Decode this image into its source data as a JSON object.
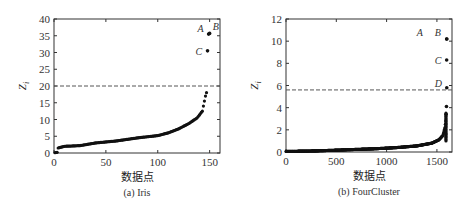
{
  "chart_data": [
    {
      "type": "scatter",
      "title": "",
      "caption": "(a) Iris",
      "xlabel": "数据点",
      "ylabel": "Z_i",
      "xlim": [
        0,
        160
      ],
      "ylim": [
        0,
        40
      ],
      "xticks": [
        0,
        50,
        100,
        150
      ],
      "yticks": [
        0,
        5,
        10,
        15,
        20,
        25,
        30,
        35,
        40
      ],
      "xtick_labels": [
        "0",
        "50",
        "100",
        "150"
      ],
      "ytick_labels": [
        "0",
        "5",
        "10",
        "15",
        "20",
        "25",
        "30",
        "35",
        "40"
      ],
      "threshold": 20,
      "threshold_style": "dashed",
      "n_points": 150,
      "curve_description": "sorted ascending scores",
      "curve_knots": [
        [
          1,
          0.1
        ],
        [
          3,
          0.2
        ],
        [
          4,
          1.5
        ],
        [
          10,
          2.0
        ],
        [
          25,
          2.2
        ],
        [
          40,
          3.0
        ],
        [
          60,
          3.6
        ],
        [
          80,
          4.5
        ],
        [
          100,
          5.2
        ],
        [
          110,
          6.0
        ],
        [
          120,
          7.2
        ],
        [
          130,
          8.8
        ],
        [
          138,
          10.5
        ],
        [
          143,
          12.5
        ],
        [
          144,
          14.0
        ],
        [
          146,
          17.0
        ],
        [
          147,
          18.0
        ]
      ],
      "outliers": [
        {
          "label": "A",
          "x": 149,
          "y": 35.5
        },
        {
          "label": "B",
          "x": 150,
          "y": 35.7
        },
        {
          "label": "C",
          "x": 148,
          "y": 30.5
        }
      ],
      "grid": false
    },
    {
      "type": "scatter",
      "title": "",
      "caption": "(b) FourCluster",
      "xlabel": "数据点",
      "ylabel": "Z_i",
      "xlim": [
        0,
        1650
      ],
      "ylim": [
        0,
        12
      ],
      "xticks": [
        0,
        500,
        1000,
        1500
      ],
      "yticks": [
        0,
        2,
        4,
        6,
        8,
        10,
        12
      ],
      "xtick_labels": [
        "0",
        "500",
        "1000",
        "1500"
      ],
      "ytick_labels": [
        "0",
        "2",
        "4",
        "6",
        "8",
        "10",
        "12"
      ],
      "threshold": 5.6,
      "threshold_style": "dashed",
      "n_points": 1600,
      "curve_description": "sorted ascending scores",
      "curve_knots": [
        [
          0,
          0.05
        ],
        [
          300,
          0.1
        ],
        [
          600,
          0.2
        ],
        [
          900,
          0.3
        ],
        [
          1100,
          0.4
        ],
        [
          1300,
          0.55
        ],
        [
          1450,
          0.8
        ],
        [
          1520,
          1.1
        ],
        [
          1560,
          1.5
        ],
        [
          1580,
          2.2
        ],
        [
          1588,
          2.8
        ],
        [
          1592,
          3.4
        ],
        [
          1594,
          3.6
        ]
      ],
      "outliers": [
        {
          "label": "A",
          "x": 1597,
          "y": 10.2
        },
        {
          "label": "B",
          "x": 1598,
          "y": 10.2
        },
        {
          "label": "C",
          "x": 1597,
          "y": 8.3
        },
        {
          "label": "D",
          "x": 1598,
          "y": 5.8
        },
        {
          "label": "",
          "x": 1595,
          "y": 4.1
        }
      ],
      "grid": false
    }
  ]
}
